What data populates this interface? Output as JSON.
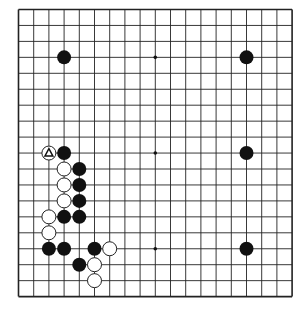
{
  "board": {
    "size": 19,
    "origin_x": 18.5,
    "origin_y": 9.5,
    "step_x": 15.2,
    "step_y": 15.95,
    "line_color": "#222222",
    "background": "#ffffff",
    "star_points": [
      [
        9,
        3
      ],
      [
        9,
        9
      ],
      [
        9,
        15
      ]
    ],
    "stones": [
      {
        "col": 3,
        "row": 3,
        "color": "black"
      },
      {
        "col": 15,
        "row": 3,
        "color": "black"
      },
      {
        "col": 15,
        "row": 9,
        "color": "black"
      },
      {
        "col": 15,
        "row": 15,
        "color": "black"
      },
      {
        "col": 2,
        "row": 9,
        "color": "white",
        "marker": "triangle"
      },
      {
        "col": 3,
        "row": 9,
        "color": "black"
      },
      {
        "col": 3,
        "row": 10,
        "color": "white"
      },
      {
        "col": 4,
        "row": 10,
        "color": "black"
      },
      {
        "col": 3,
        "row": 11,
        "color": "white"
      },
      {
        "col": 4,
        "row": 11,
        "color": "black"
      },
      {
        "col": 3,
        "row": 12,
        "color": "white"
      },
      {
        "col": 4,
        "row": 12,
        "color": "black"
      },
      {
        "col": 2,
        "row": 13,
        "color": "white"
      },
      {
        "col": 3,
        "row": 13,
        "color": "black"
      },
      {
        "col": 4,
        "row": 13,
        "color": "black"
      },
      {
        "col": 2,
        "row": 14,
        "color": "white"
      },
      {
        "col": 2,
        "row": 15,
        "color": "black"
      },
      {
        "col": 3,
        "row": 15,
        "color": "black"
      },
      {
        "col": 5,
        "row": 15,
        "color": "black"
      },
      {
        "col": 6,
        "row": 15,
        "color": "white"
      },
      {
        "col": 4,
        "row": 16,
        "color": "black"
      },
      {
        "col": 5,
        "row": 16,
        "color": "white"
      },
      {
        "col": 5,
        "row": 17,
        "color": "white"
      }
    ]
  }
}
